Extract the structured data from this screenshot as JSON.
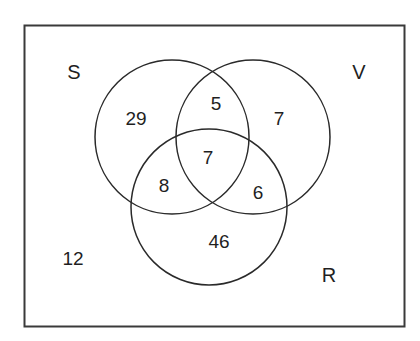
{
  "diagram": {
    "type": "venn",
    "universe": {
      "label": "",
      "outside_count": "12"
    },
    "sets": [
      {
        "id": "S",
        "label": "S"
      },
      {
        "id": "V",
        "label": "V"
      },
      {
        "id": "R",
        "label": "R"
      }
    ],
    "regions": {
      "S_only": "29",
      "V_only": "7",
      "R_only": "46",
      "S_and_V_only": "5",
      "S_and_R_only": "8",
      "V_and_R_only": "6",
      "S_and_V_and_R": "7",
      "none": "12"
    },
    "colors": {
      "stroke": "#2a2a2a",
      "background": "#ffffff"
    }
  }
}
